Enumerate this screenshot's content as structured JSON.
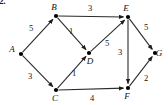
{
  "figure": {
    "number_label": "2.",
    "caption": ""
  },
  "graph": {
    "type": "directed-weighted-graph",
    "nodes": [
      {
        "id": "A",
        "label": "A",
        "x": 21,
        "y": 54,
        "label_dx": -9,
        "label_dy": -2
      },
      {
        "id": "B",
        "label": "B",
        "x": 56,
        "y": 16,
        "label_dx": -2,
        "label_dy": -6
      },
      {
        "id": "C",
        "label": "C",
        "x": 56,
        "y": 90,
        "label_dx": -1,
        "label_dy": 11
      },
      {
        "id": "D",
        "label": "D",
        "x": 89,
        "y": 53,
        "label_dx": 1,
        "label_dy": 11
      },
      {
        "id": "E",
        "label": "E",
        "x": 128,
        "y": 17,
        "label_dx": -2,
        "label_dy": -6
      },
      {
        "id": "F",
        "label": "F",
        "x": 128,
        "y": 88,
        "label_dx": -1,
        "label_dy": 11
      },
      {
        "id": "G",
        "label": "G",
        "x": 155,
        "y": 53,
        "label_dx": 4,
        "label_dy": 3
      }
    ],
    "edges": [
      {
        "from": "A",
        "to": "B",
        "weight": "5",
        "label_x": 31,
        "label_y": 31
      },
      {
        "from": "A",
        "to": "C",
        "weight": "3",
        "label_x": 30,
        "label_y": 79
      },
      {
        "from": "B",
        "to": "E",
        "weight": "3",
        "label_x": 90,
        "label_y": 11
      },
      {
        "from": "B",
        "to": "D",
        "weight": "1",
        "label_x": 71,
        "label_y": 34
      },
      {
        "from": "C",
        "to": "D",
        "weight": "1",
        "label_x": 74,
        "label_y": 76
      },
      {
        "from": "C",
        "to": "F",
        "weight": "4",
        "label_x": 92,
        "label_y": 101
      },
      {
        "from": "D",
        "to": "E",
        "weight": "5",
        "label_x": 107,
        "label_y": 46
      },
      {
        "from": "E",
        "to": "F",
        "weight": "3",
        "label_x": 120,
        "label_y": 55
      },
      {
        "from": "E",
        "to": "G",
        "weight": "5",
        "label_x": 146,
        "label_y": 30
      },
      {
        "from": "F",
        "to": "G",
        "weight": "2",
        "label_x": 146,
        "label_y": 81
      }
    ],
    "colors": {
      "edge": "#2b2b2b",
      "node": "#000000",
      "text": "#111111",
      "background": "#ffffff"
    }
  }
}
